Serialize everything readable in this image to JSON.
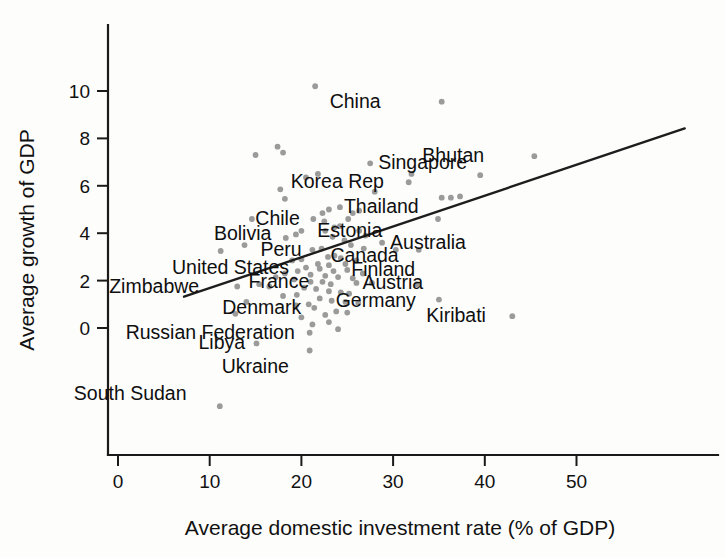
{
  "chart_data": {
    "type": "scatter",
    "title": "",
    "xlabel": "Average domestic investment rate (% of GDP)",
    "ylabel": "Average growth of GDP",
    "xlim": [
      -2,
      63
    ],
    "ylim": [
      -4.2,
      11.6
    ],
    "xticks": [
      0,
      10,
      20,
      30,
      40,
      50
    ],
    "xtick_labels": [
      "0",
      "10",
      "20",
      "30",
      "40",
      "50"
    ],
    "yticks": [
      0,
      2,
      4,
      6,
      8,
      10
    ],
    "ytick_labels": [
      "0",
      "2",
      "4",
      "6",
      "8",
      "10"
    ],
    "grid": false,
    "legend": false,
    "marker_color": "#9b9b9b",
    "line_color": "#1d1d1d",
    "axis_color": "#1a1a1a",
    "trend_line": {
      "label": "linear fit",
      "x_start": 7.2,
      "y_start": 1.32,
      "x_end": 61.8,
      "y_end": 8.42
    },
    "labeled_points": [
      {
        "label": "China",
        "x": 35.3,
        "y": 9.55,
        "label_dx": -112,
        "label_dy": 6
      },
      {
        "label": "Singapore",
        "x": 27.5,
        "y": 6.95,
        "label_dx": 8,
        "label_dy": 6
      },
      {
        "label": "Bhutan",
        "x": 45.4,
        "y": 7.25,
        "label_dx": -112,
        "label_dy": 6
      },
      {
        "label": "Korea Rep",
        "x": 31.7,
        "y": 6.15,
        "label_dx": -118,
        "label_dy": 6
      },
      {
        "label": "Thailand",
        "x": 24.2,
        "y": 5.1,
        "label_dx": 4,
        "label_dy": 6
      },
      {
        "label": "Chile",
        "x": 21.3,
        "y": 4.6,
        "label_dx": -58,
        "label_dy": 6
      },
      {
        "label": "Estonia",
        "x": 22.6,
        "y": 4.1,
        "label_dx": -8,
        "label_dy": 6
      },
      {
        "label": "Bolivia",
        "x": 19.4,
        "y": 3.95,
        "label_dx": -82,
        "label_dy": 6
      },
      {
        "label": "Australia",
        "x": 28.8,
        "y": 3.6,
        "label_dx": 8,
        "label_dy": 6
      },
      {
        "label": "Peru",
        "x": 21.2,
        "y": 3.3,
        "label_dx": -52,
        "label_dy": 6
      },
      {
        "label": "Canada",
        "x": 23.6,
        "y": 3.05,
        "label_dx": -4,
        "label_dy": 6
      },
      {
        "label": "United States",
        "x": 20.5,
        "y": 2.55,
        "label_dx": -134,
        "label_dy": 6
      },
      {
        "label": "Finland",
        "x": 25.0,
        "y": 2.45,
        "label_dx": 4,
        "label_dy": 6
      },
      {
        "label": "Zimbabwe",
        "x": 13.0,
        "y": 1.75,
        "label_dx": -128,
        "label_dy": 6
      },
      {
        "label": "France",
        "x": 21.0,
        "y": 1.95,
        "label_dx": -62,
        "label_dy": 6
      },
      {
        "label": "Austria",
        "x": 26.0,
        "y": 1.9,
        "label_dx": 6,
        "label_dy": 6
      },
      {
        "label": "Germany",
        "x": 23.3,
        "y": 1.15,
        "label_dx": 4,
        "label_dy": 6
      },
      {
        "label": "Denmark",
        "x": 21.4,
        "y": 0.85,
        "label_dx": -92,
        "label_dy": 6
      },
      {
        "label": "Kiribati",
        "x": 43.0,
        "y": 0.5,
        "label_dx": -86,
        "label_dy": 6
      },
      {
        "label": "Russian Federation",
        "x": 20.9,
        "y": -0.2,
        "label_dx": -184,
        "label_dy": 6
      },
      {
        "label": "Libya",
        "x": 15.1,
        "y": -0.65,
        "label_dx": -58,
        "label_dy": 6
      },
      {
        "label": "Ukraine",
        "x": 20.9,
        "y": -0.95,
        "label_dx": -88,
        "label_dy": 22
      },
      {
        "label": "South Sudan",
        "x": 11.1,
        "y": -3.3,
        "label_dx": -146,
        "label_dy": -6
      }
    ],
    "points": [
      [
        21.5,
        10.2
      ],
      [
        35.3,
        9.55
      ],
      [
        17.4,
        7.65
      ],
      [
        45.4,
        7.25
      ],
      [
        15.0,
        7.3
      ],
      [
        18.0,
        7.4
      ],
      [
        27.5,
        6.95
      ],
      [
        21.8,
        6.5
      ],
      [
        32.0,
        6.5
      ],
      [
        39.5,
        6.45
      ],
      [
        31.7,
        6.15
      ],
      [
        20.5,
        6.35
      ],
      [
        17.7,
        5.85
      ],
      [
        28.0,
        5.75
      ],
      [
        18.2,
        5.45
      ],
      [
        35.3,
        5.5
      ],
      [
        36.3,
        5.5
      ],
      [
        37.3,
        5.55
      ],
      [
        24.2,
        5.1
      ],
      [
        23.0,
        5.0
      ],
      [
        25.6,
        4.85
      ],
      [
        26.3,
        4.95
      ],
      [
        22.3,
        4.85
      ],
      [
        14.6,
        4.6
      ],
      [
        21.3,
        4.6
      ],
      [
        22.5,
        4.5
      ],
      [
        25.1,
        4.6
      ],
      [
        34.9,
        4.6
      ],
      [
        24.2,
        4.3
      ],
      [
        23.6,
        4.25
      ],
      [
        22.6,
        4.1
      ],
      [
        19.4,
        3.95
      ],
      [
        20.0,
        4.1
      ],
      [
        26.3,
        4.1
      ],
      [
        27.0,
        3.9
      ],
      [
        18.3,
        3.8
      ],
      [
        23.4,
        3.85
      ],
      [
        28.8,
        3.6
      ],
      [
        24.7,
        3.7
      ],
      [
        25.4,
        3.5
      ],
      [
        13.8,
        3.5
      ],
      [
        11.2,
        3.25
      ],
      [
        21.2,
        3.3
      ],
      [
        22.2,
        3.35
      ],
      [
        26.8,
        3.35
      ],
      [
        30.3,
        3.3
      ],
      [
        32.8,
        3.3
      ],
      [
        23.6,
        3.05
      ],
      [
        22.9,
        3.0
      ],
      [
        24.3,
        2.95
      ],
      [
        20.0,
        2.9
      ],
      [
        19.0,
        2.85
      ],
      [
        26.0,
        2.85
      ],
      [
        21.8,
        2.7
      ],
      [
        23.0,
        2.65
      ],
      [
        24.8,
        2.7
      ],
      [
        20.5,
        2.55
      ],
      [
        25.0,
        2.45
      ],
      [
        22.0,
        2.5
      ],
      [
        23.5,
        2.4
      ],
      [
        19.6,
        2.4
      ],
      [
        18.2,
        2.3
      ],
      [
        26.7,
        2.3
      ],
      [
        21.0,
        2.25
      ],
      [
        22.6,
        2.2
      ],
      [
        24.0,
        2.15
      ],
      [
        25.6,
        2.1
      ],
      [
        17.2,
        2.15
      ],
      [
        19.2,
        2.05
      ],
      [
        13.0,
        1.75
      ],
      [
        21.0,
        1.95
      ],
      [
        22.3,
        1.95
      ],
      [
        23.2,
        1.85
      ],
      [
        26.0,
        1.9
      ],
      [
        27.7,
        1.9
      ],
      [
        32.6,
        1.85
      ],
      [
        15.4,
        1.85
      ],
      [
        16.5,
        1.75
      ],
      [
        20.3,
        1.7
      ],
      [
        21.6,
        1.65
      ],
      [
        23.0,
        1.55
      ],
      [
        24.3,
        1.5
      ],
      [
        25.2,
        1.45
      ],
      [
        19.5,
        1.4
      ],
      [
        18.0,
        1.35
      ],
      [
        35.0,
        1.2
      ],
      [
        14.0,
        1.1
      ],
      [
        22.0,
        1.25
      ],
      [
        23.3,
        1.15
      ],
      [
        24.8,
        1.1
      ],
      [
        26.2,
        1.05
      ],
      [
        20.8,
        1.0
      ],
      [
        19.4,
        0.95
      ],
      [
        21.4,
        0.85
      ],
      [
        12.8,
        0.6
      ],
      [
        23.8,
        0.7
      ],
      [
        25.0,
        0.65
      ],
      [
        43.0,
        0.5
      ],
      [
        22.6,
        0.55
      ],
      [
        20.0,
        0.45
      ],
      [
        23.0,
        0.25
      ],
      [
        21.2,
        0.15
      ],
      [
        24.0,
        -0.05
      ],
      [
        20.9,
        -0.2
      ],
      [
        15.1,
        -0.65
      ],
      [
        20.9,
        -0.95
      ],
      [
        11.1,
        -3.3
      ]
    ]
  },
  "axes": {
    "x_title": "Average domestic investment rate (% of GDP)",
    "y_title": "Average growth of GDP"
  }
}
